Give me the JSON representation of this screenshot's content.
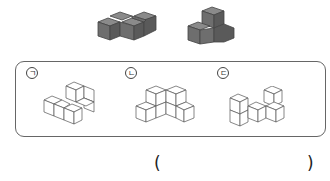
{
  "given_shapes": [
    {
      "id": "shape-a",
      "description": "Z-shaped 4-cube piece, dark gray"
    },
    {
      "id": "shape-b",
      "description": "L/T-shaped 4-cube piece, dark gray"
    }
  ],
  "options": [
    {
      "label": "ㄱ",
      "description": "cube arrangement option 1"
    },
    {
      "label": "ㄴ",
      "description": "cube arrangement option 2"
    },
    {
      "label": "ㄷ",
      "description": "cube arrangement option 3"
    }
  ],
  "answer": {
    "open_paren": "(",
    "close_paren": ")",
    "value": ""
  },
  "colors": {
    "cube_fill": "#6e6e6e",
    "cube_top": "#8a8a8a",
    "cube_side": "#5a5a5a",
    "line": "#555555"
  }
}
